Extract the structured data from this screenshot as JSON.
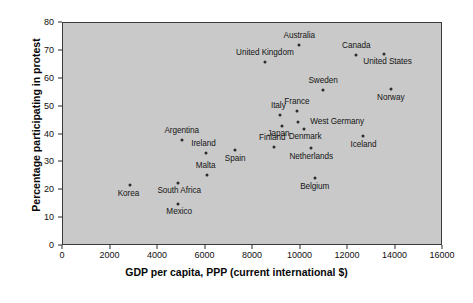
{
  "chart_data": {
    "type": "scatter",
    "title": "",
    "subtitle": "",
    "xlabel": "GDP per capita, PPP (current international $)",
    "ylabel": "Percentage participating in protest",
    "xlim": [
      0,
      16000
    ],
    "ylim": [
      0,
      80
    ],
    "xticks": [
      0,
      2000,
      4000,
      6000,
      8000,
      10000,
      12000,
      14000,
      16000
    ],
    "yticks": [
      0,
      10,
      20,
      30,
      40,
      50,
      60,
      70,
      80
    ],
    "grid": false,
    "legend": "none",
    "plot_background_color": "#c9c9c9",
    "marker_color": "#2b2b2b",
    "points": [
      {
        "label": "Australia",
        "x": 9950,
        "y": 72.0,
        "label_dx": 0,
        "label_dy": -9
      },
      {
        "label": "United Kingdom",
        "x": 8500,
        "y": 66.0,
        "label_dx": 0,
        "label_dy": -9
      },
      {
        "label": "Canada",
        "x": 12350,
        "y": 68.5,
        "label_dx": 0,
        "label_dy": -9
      },
      {
        "label": "United States",
        "x": 13500,
        "y": 69.0,
        "label_dx": 4,
        "label_dy": 8
      },
      {
        "label": "Sweden",
        "x": 10950,
        "y": 56.0,
        "label_dx": 0,
        "label_dy": -9
      },
      {
        "label": "Norway",
        "x": 13800,
        "y": 56.5,
        "label_dx": 0,
        "label_dy": 9
      },
      {
        "label": "France",
        "x": 9850,
        "y": 48.5,
        "label_dx": 0,
        "label_dy": -9
      },
      {
        "label": "Italy",
        "x": 9150,
        "y": 47.0,
        "label_dx": -2,
        "label_dy": -9
      },
      {
        "label": "West Germany",
        "x": 9900,
        "y": 44.5,
        "label_dx": 39,
        "label_dy": 0
      },
      {
        "label": "Japan",
        "x": 9200,
        "y": 43.0,
        "label_dx": -3,
        "label_dy": 8
      },
      {
        "label": "Denmark",
        "x": 10150,
        "y": 42.0,
        "label_dx": 1,
        "label_dy": 8
      },
      {
        "label": "Iceland",
        "x": 12650,
        "y": 39.5,
        "label_dx": 0,
        "label_dy": 9
      },
      {
        "label": "Netherlands",
        "x": 10450,
        "y": 35.0,
        "label_dx": 0,
        "label_dy": 9
      },
      {
        "label": "Finland",
        "x": 8900,
        "y": 35.5,
        "label_dx": -2,
        "label_dy": -9
      },
      {
        "label": "Argentina",
        "x": 5000,
        "y": 38.0,
        "label_dx": 0,
        "label_dy": -9
      },
      {
        "label": "Ireland",
        "x": 6000,
        "y": 33.5,
        "label_dx": -2,
        "label_dy": -9
      },
      {
        "label": "Spain",
        "x": 7250,
        "y": 34.5,
        "label_dx": 0,
        "label_dy": 9
      },
      {
        "label": "Belgium",
        "x": 10600,
        "y": 24.5,
        "label_dx": 0,
        "label_dy": 9
      },
      {
        "label": "Malta",
        "x": 6050,
        "y": 25.5,
        "label_dx": -1,
        "label_dy": -9
      },
      {
        "label": "South Africa",
        "x": 4850,
        "y": 22.5,
        "label_dx": 1,
        "label_dy": 8
      },
      {
        "label": "Korea",
        "x": 2800,
        "y": 22.0,
        "label_dx": -1,
        "label_dy": 9
      },
      {
        "label": "Mexico",
        "x": 4850,
        "y": 15.0,
        "label_dx": 1,
        "label_dy": 8
      }
    ]
  }
}
